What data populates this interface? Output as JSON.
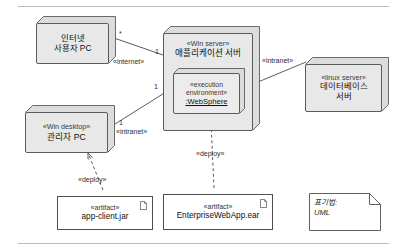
{
  "diagram": {
    "notation_note": "표기법:\nUML",
    "colors": {
      "node_fill": "#e8e8e8",
      "inner_node_fill": "#ececec",
      "stroke": "#5b5b5b",
      "artifact_fill": "#ffffff",
      "rule": "#b9b9b9"
    }
  },
  "nodes": [
    {
      "id": "internet-user-pc",
      "stereotype": "",
      "name_line1": "인터넷",
      "name_line2": "사용자 PC"
    },
    {
      "id": "app-server",
      "stereotype": "«Win server»",
      "name_line1": "애플리케이션 서버",
      "name_line2": ""
    },
    {
      "id": "db-server",
      "stereotype": "«linux server»",
      "name_line1": "데이터베이스",
      "name_line2": "서버"
    },
    {
      "id": "admin-pc",
      "stereotype": "«Win desktop»",
      "name_line1": "관리자 PC",
      "name_line2": ""
    }
  ],
  "inner_node": {
    "id": "websphere",
    "stereotype_line1": "«execution",
    "stereotype_line2": "environment»",
    "name": ":WebSphere"
  },
  "artifacts": [
    {
      "id": "app-client-jar",
      "stereotype": "«artifact»",
      "name": "app-client.jar"
    },
    {
      "id": "enterprise-webapp-ear",
      "stereotype": "«artifact»",
      "name": "EnterpriseWebApp.ear"
    }
  ],
  "connections": [
    {
      "id": "internet-link",
      "label": "«internet»",
      "source_mult": "*",
      "target_mult": "1"
    },
    {
      "id": "intranet-admin-link",
      "label": "«intranet»",
      "source_mult": "1",
      "target_mult": "1"
    },
    {
      "id": "intranet-db-link",
      "label": "«intranet»",
      "source_mult": "",
      "target_mult": ""
    },
    {
      "id": "deploy-client",
      "label": "«deploy»"
    },
    {
      "id": "deploy-ear",
      "label": "«deploy»"
    }
  ]
}
